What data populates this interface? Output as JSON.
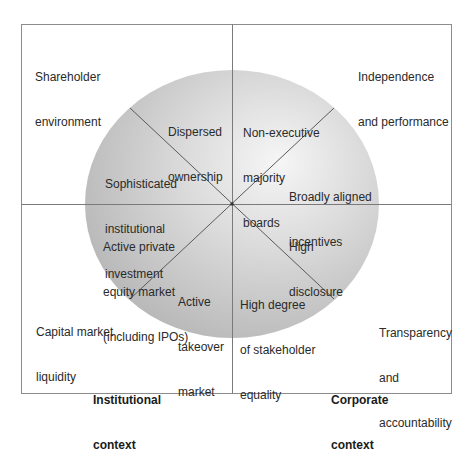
{
  "diagram": {
    "colors": {
      "frame": "#8c8c8c",
      "divider": "#7a7a7a",
      "circle_light": "#f4f4f4",
      "circle_dark": "#b9b9b9",
      "text": "#2a2a2a"
    },
    "quadrant_labels": {
      "top_left": [
        "Shareholder",
        "environment"
      ],
      "top_right": [
        "Independence",
        "and performance"
      ],
      "bottom_left": [
        "Capital market",
        "liquidity"
      ],
      "bottom_right": [
        "Transparency",
        "and",
        "accountability"
      ]
    },
    "segments": {
      "dispersed_ownership": [
        "Dispersed",
        "ownership"
      ],
      "non_executive_boards": [
        "Non-executive",
        "majority",
        "boards"
      ],
      "sophisticated_investment": [
        "Sophisticated",
        "institutional",
        "investment"
      ],
      "aligned_incentives": [
        "Broadly aligned",
        "incentives"
      ],
      "private_equity_market": [
        "Active private",
        "equity market",
        "(including IPOs)"
      ],
      "high_disclosure": [
        "High",
        "disclosure"
      ],
      "takeover_market": [
        "Active",
        "takeover",
        "market"
      ],
      "stakeholder_equality": [
        "High degree",
        "of stakeholder",
        "equality"
      ]
    },
    "context_labels": {
      "institutional": [
        "Institutional",
        "context"
      ],
      "corporate": [
        "Corporate",
        "context"
      ]
    }
  }
}
